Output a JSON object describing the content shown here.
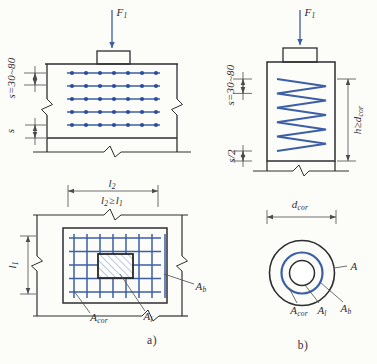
{
  "colors": {
    "background": "#fcfcf9",
    "line": "#2e2e30",
    "dim": "#4c4c4e",
    "rebar_blue": "#3c5fa7",
    "rebar_dot": "#2c4c9e",
    "hatch": "#7e8fb2",
    "text": "#2f2f33"
  },
  "figure_a": {
    "caption": "a)",
    "elevation": {
      "force": {
        "base": "F",
        "sub": "1"
      },
      "spacing_range": "s=30~80",
      "spacing": "s"
    },
    "plan": {
      "width_dim": {
        "base": "l",
        "sub": "2"
      },
      "width_condition": {
        "b1": "l",
        "s1": "2",
        "mid": "≥",
        "b2": "l",
        "s2": "1"
      },
      "height_dim": {
        "base": "l",
        "sub": "1"
      },
      "area_bottom": {
        "base": "A",
        "sub": "b"
      },
      "area_local": {
        "base": "A",
        "sub": "l"
      },
      "area_core": {
        "base": "A",
        "sub": "cor"
      }
    }
  },
  "figure_b": {
    "caption": "b)",
    "elevation": {
      "force": {
        "base": "F",
        "sub": "1"
      },
      "spacing_range": "s=30~80",
      "half_spacing": "s/2",
      "height_condition": {
        "base": "h≥d",
        "sub": "cor"
      }
    },
    "plan": {
      "diameter_dim": {
        "base": "d",
        "sub": "cor"
      },
      "area_section": {
        "base": "A"
      },
      "area_bottom": {
        "base": "A",
        "sub": "b"
      },
      "area_local": {
        "base": "A",
        "sub": "l"
      },
      "area_core": {
        "base": "A",
        "sub": "cor"
      }
    }
  }
}
